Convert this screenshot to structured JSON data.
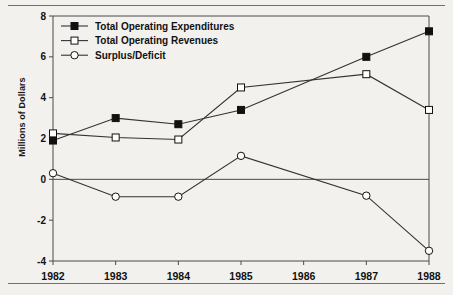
{
  "figure": {
    "ylabel": "Millions of Dollars",
    "rules": {
      "top": "horizontal-rule",
      "bottom": "horizontal-rule"
    }
  },
  "chart_data": {
    "type": "line",
    "title": "",
    "xlabel": "",
    "ylabel": "Millions of Dollars",
    "x": [
      1982,
      1983,
      1984,
      1985,
      1986,
      1987,
      1988
    ],
    "categories": [
      "1982",
      "1983",
      "1984",
      "1985",
      "1986",
      "1987",
      "1988"
    ],
    "xlim": [
      1982,
      1988
    ],
    "ylim": [
      -4,
      8
    ],
    "yticks": [
      -4,
      -2,
      0,
      2,
      4,
      6,
      8
    ],
    "ytick_labels": [
      "-4",
      "-2",
      "0",
      "2",
      "4",
      "6",
      "8"
    ],
    "xticks": [
      1982,
      1983,
      1984,
      1985,
      1986,
      1987,
      1988
    ],
    "xtick_labels": [
      "1982",
      "1983",
      "1984",
      "1985",
      "1986",
      "1987",
      "1988"
    ],
    "grid": false,
    "zero_line": true,
    "legend_position": "top-left",
    "series": [
      {
        "name": "Total Operating Expenditures",
        "marker": "filled-square",
        "color": "#111111",
        "x": [
          1982,
          1983,
          1984,
          1985,
          1987,
          1988
        ],
        "values": [
          1.9,
          3.0,
          2.7,
          3.4,
          6.0,
          7.25
        ]
      },
      {
        "name": "Total Operating Revenues",
        "marker": "open-square",
        "color": "#111111",
        "x": [
          1982,
          1983,
          1984,
          1985,
          1987,
          1988
        ],
        "values": [
          2.25,
          2.05,
          1.95,
          4.5,
          5.15,
          3.4
        ]
      },
      {
        "name": "Surplus/Deficit",
        "marker": "open-circle",
        "color": "#111111",
        "x": [
          1982,
          1983,
          1984,
          1985,
          1987,
          1988
        ],
        "values": [
          0.3,
          -0.85,
          -0.85,
          1.15,
          -0.8,
          -3.5
        ]
      }
    ]
  },
  "legend": {
    "items": [
      {
        "label": "Total Operating Expenditures",
        "marker": "filled-square"
      },
      {
        "label": "Total Operating Revenues",
        "marker": "open-square"
      },
      {
        "label": "Surplus/Deficit",
        "marker": "open-circle"
      }
    ]
  }
}
